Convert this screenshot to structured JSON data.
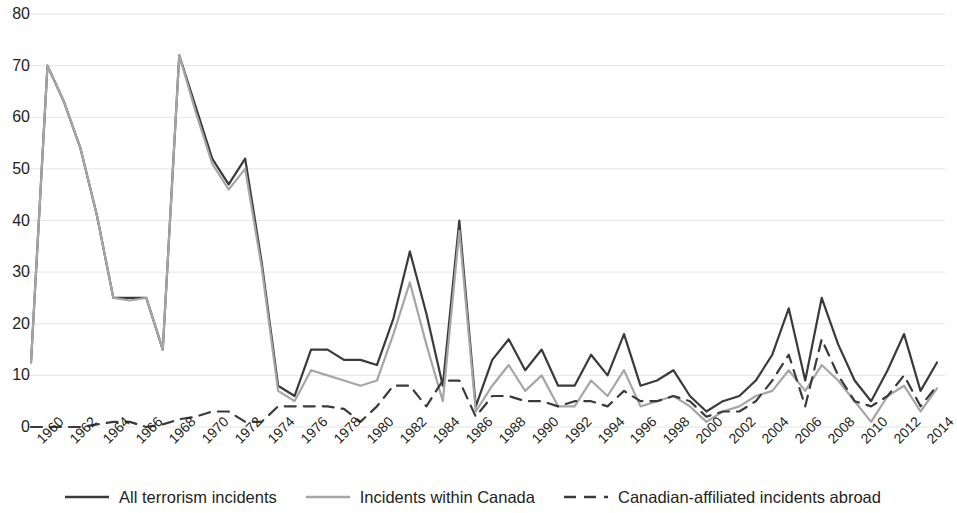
{
  "chart_data": {
    "type": "line",
    "title": "",
    "subtitle": "",
    "xlabel": "",
    "ylabel": "",
    "xlim": [
      1960,
      2014
    ],
    "ylim": [
      0,
      80
    ],
    "y_ticks": [
      0,
      10,
      20,
      30,
      40,
      50,
      60,
      70,
      80
    ],
    "x_tick_labels": [
      "1960",
      "1962",
      "1964",
      "1966",
      "1968",
      "1970",
      "1972",
      "1974",
      "1976",
      "1978",
      "1980",
      "1982",
      "1984",
      "1986",
      "1988",
      "1990",
      "1992",
      "1994",
      "1996",
      "1998",
      "2000",
      "2002",
      "2004",
      "2006",
      "2008",
      "2010",
      "2012",
      "2014"
    ],
    "x": [
      1959,
      1960,
      1961,
      1962,
      1963,
      1964,
      1965,
      1966,
      1967,
      1968,
      1969,
      1970,
      1971,
      1972,
      1973,
      1974,
      1975,
      1976,
      1977,
      1978,
      1979,
      1980,
      1981,
      1982,
      1983,
      1984,
      1985,
      1986,
      1987,
      1988,
      1989,
      1990,
      1991,
      1992,
      1993,
      1994,
      1995,
      1996,
      1997,
      1998,
      1999,
      2000,
      2001,
      2002,
      2003,
      2004,
      2005,
      2006,
      2007,
      2008,
      2009,
      2010,
      2011,
      2012,
      2013,
      2014
    ],
    "grid": true,
    "legend_position": "bottom",
    "series": [
      {
        "name": "All terrorism incidents",
        "color": "#3a3a3a",
        "style": "solid",
        "width": 2.2,
        "values": [
          12.5,
          70,
          63,
          54,
          41,
          25,
          25,
          25,
          15,
          72,
          62,
          52,
          47,
          52,
          32,
          8,
          6,
          15,
          15,
          13,
          13,
          12,
          21,
          34,
          22,
          8,
          40,
          4,
          13,
          17,
          11,
          15,
          8,
          8,
          14,
          10,
          18,
          8,
          9,
          11,
          6,
          3,
          5,
          6,
          9,
          14,
          23,
          9,
          25,
          16,
          9,
          5,
          11,
          18,
          7,
          12.5
        ]
      },
      {
        "name": "Incidents within Canada",
        "color": "#a6a6a6",
        "style": "solid",
        "width": 2.2,
        "values": [
          12.5,
          70,
          63,
          54,
          41,
          25,
          24.5,
          25,
          15,
          72,
          61,
          51,
          46,
          50,
          31,
          7,
          5,
          11,
          10,
          9,
          8,
          9,
          18,
          28,
          16,
          5,
          38,
          3,
          8,
          12,
          7,
          10,
          4,
          4,
          9,
          6,
          11,
          4,
          5,
          6,
          4,
          1,
          3,
          4,
          6,
          7,
          11,
          7,
          12,
          9,
          5,
          1,
          6,
          8,
          3,
          7.5
        ]
      },
      {
        "name": "Canadian-affiliated incidents abroad",
        "color": "#3a3a3a",
        "style": "dashed",
        "width": 2.2,
        "values": [
          0,
          0,
          0,
          0,
          0.5,
          1,
          1,
          0,
          0.5,
          1.5,
          2,
          3,
          3,
          1,
          1,
          4,
          4,
          4,
          4,
          3.5,
          1,
          4,
          8,
          8,
          4,
          9,
          9,
          2,
          6,
          6,
          5,
          5,
          4,
          5,
          5,
          4,
          7,
          5,
          5,
          6,
          5,
          2,
          3,
          3,
          5,
          9,
          14,
          4,
          17,
          10,
          5,
          4,
          6,
          10,
          4,
          8
        ]
      }
    ]
  },
  "axes": {
    "y_labels": [
      "80",
      "70",
      "60",
      "50",
      "40",
      "30",
      "20",
      "10",
      "0"
    ],
    "x_labels": [
      "1960",
      "1962",
      "1964",
      "1966",
      "1968",
      "1970",
      "1972",
      "1974",
      "1976",
      "1978",
      "1980",
      "1982",
      "1984",
      "1986",
      "1988",
      "1990",
      "1992",
      "1994",
      "1996",
      "1998",
      "2000",
      "2002",
      "2004",
      "2006",
      "2008",
      "2010",
      "2012",
      "2014"
    ]
  },
  "legend": {
    "items": [
      {
        "label": "All terrorism incidents",
        "color": "#3a3a3a",
        "style": "solid"
      },
      {
        "label": "Incidents within Canada",
        "color": "#a6a6a6",
        "style": "solid"
      },
      {
        "label": "Canadian-affiliated incidents abroad",
        "color": "#3a3a3a",
        "style": "dashed"
      }
    ]
  },
  "colors": {
    "grid": "#e4e4ea",
    "text": "#231f20",
    "background": "#ffffff",
    "series_all": "#3a3a3a",
    "series_canada": "#a6a6a6",
    "series_abroad": "#3a3a3a"
  }
}
